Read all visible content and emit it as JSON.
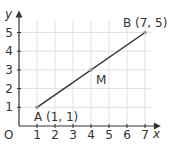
{
  "chart_data": {
    "type": "line",
    "title": "",
    "xlabel": "x",
    "ylabel": "y",
    "origin_label": "O",
    "xlim": [
      0,
      7.5
    ],
    "ylim": [
      0,
      5.7
    ],
    "x_ticks": [
      "1",
      "2",
      "3",
      "4",
      "5",
      "6",
      "7"
    ],
    "y_ticks": [
      "1",
      "2",
      "3",
      "4",
      "5"
    ],
    "grid": true,
    "series": [
      {
        "name": "AB",
        "x": [
          1,
          7
        ],
        "y": [
          1,
          5
        ]
      }
    ],
    "points": [
      {
        "name": "A",
        "x": 1,
        "y": 1,
        "label": "A (1, 1)"
      },
      {
        "name": "M",
        "x": 4,
        "y": 3,
        "label": "M"
      },
      {
        "name": "B",
        "x": 7,
        "y": 5,
        "label": "B (7, 5)"
      }
    ]
  },
  "colors": {
    "grid": "#e2e2e2",
    "axis": "#333333",
    "line": "#333333",
    "point": "#999999"
  }
}
